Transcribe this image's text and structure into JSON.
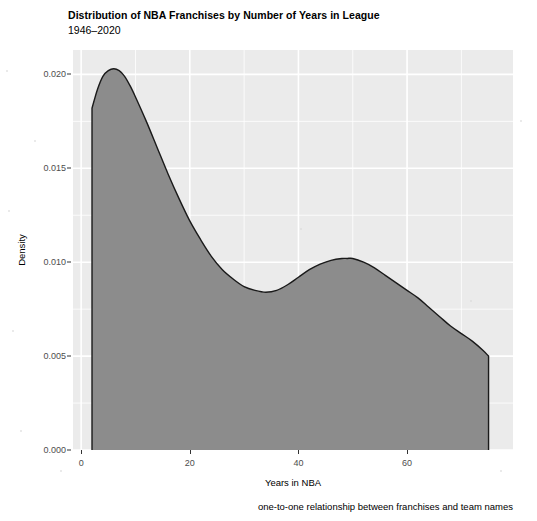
{
  "chart_data": {
    "type": "area",
    "title": "Distribution of NBA Franchises by Number of Years in League",
    "subtitle": "1946–2020",
    "caption": "one-to-one relationship between franchises and team names",
    "xlabel": "Years in NBA",
    "ylabel": "Density",
    "xlim": [
      -1.5,
      79.5
    ],
    "ylim": [
      0.0,
      0.0213
    ],
    "grid": true,
    "legend": false,
    "legend_position": "none",
    "x_ticks": [
      0,
      20,
      40,
      60
    ],
    "x_tick_labels": [
      "0",
      "20",
      "40",
      "60"
    ],
    "y_ticks": [
      0.0,
      0.005,
      0.01,
      0.015,
      0.02
    ],
    "y_tick_labels": [
      "0.000",
      "0.005",
      "0.010",
      "0.015",
      "0.020"
    ],
    "x_minor_ticks": [
      10,
      30,
      50,
      70
    ],
    "y_minor_ticks": [
      0.0025,
      0.0075,
      0.0125,
      0.0175
    ],
    "series": [
      {
        "name": "Density of years in NBA",
        "fill_color": "#8c8c8c",
        "line_color": "#1a1a1a",
        "x": [
          2,
          3,
          4,
          5,
          6,
          7,
          8,
          9,
          10,
          12,
          14,
          16,
          18,
          20,
          22,
          24,
          26,
          28,
          30,
          32,
          34,
          36,
          38,
          40,
          42,
          44,
          46,
          48,
          49,
          50,
          52,
          54,
          56,
          58,
          60,
          62,
          64,
          66,
          68,
          70,
          72,
          74,
          75
        ],
        "y": [
          0.0182,
          0.0192,
          0.0199,
          0.0202,
          0.0203,
          0.0202,
          0.0199,
          0.0194,
          0.0188,
          0.0175,
          0.0161,
          0.0147,
          0.0134,
          0.0122,
          0.0112,
          0.0103,
          0.0096,
          0.0091,
          0.0087,
          0.0085,
          0.0084,
          0.0085,
          0.0088,
          0.0092,
          0.0096,
          0.0099,
          0.0101,
          0.0102,
          0.0102,
          0.0102,
          0.01,
          0.0097,
          0.0093,
          0.0089,
          0.0085,
          0.0081,
          0.0076,
          0.0071,
          0.0066,
          0.0062,
          0.0058,
          0.0053,
          0.005
        ]
      }
    ],
    "annotations": {
      "peak_year": 6,
      "peak_density": 0.0203,
      "trough_year": 34,
      "trough_density": 0.0084,
      "secondary_peak_year": 49,
      "secondary_peak_density": 0.0102,
      "left_edge_density": 0.0182,
      "right_edge_density": 0.005
    },
    "colors": {
      "panel_background": "#ebebeb",
      "gridline_major": "#ffffff",
      "gridline_minor": "#ffffff",
      "area_fill": "#8c8c8c",
      "curve_line": "#1a1a1a",
      "axis_text": "#4d4d4d",
      "title_text": "#000000",
      "page_background": "#ffffff"
    }
  }
}
